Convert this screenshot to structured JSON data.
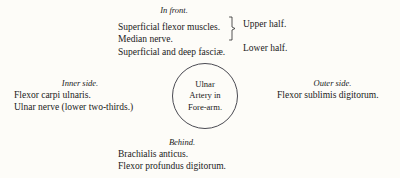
{
  "diagram": {
    "center": {
      "line1": "Ulnar",
      "line2": "Artery in",
      "line3": "Fore-arm."
    },
    "front": {
      "heading": "In front.",
      "entries": [
        "Superficial flexor muscles.",
        "Median nerve.",
        "Superficial and deep fasciæ."
      ],
      "brace_labels": {
        "upper": "Upper half.",
        "lower": "Lower half."
      }
    },
    "inner": {
      "heading": "Inner side.",
      "entries": [
        "Flexor carpi ulnaris.",
        "Ulnar nerve (lower two-thirds.)"
      ]
    },
    "outer": {
      "heading": "Outer side.",
      "entries": [
        "Flexor sublimis digitorum."
      ]
    },
    "behind": {
      "heading": "Behind.",
      "entries": [
        "Brachialis anticus.",
        "Flexor profundus digitorum."
      ]
    },
    "colors": {
      "background": "#fdfcf8",
      "text": "#1a1a1a",
      "circle_stroke": "#4a4a52"
    }
  }
}
